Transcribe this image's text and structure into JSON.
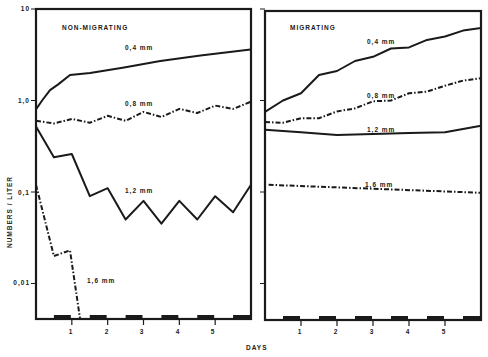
{
  "chart_data": [
    {
      "type": "line",
      "title": "NON-MIGRATING",
      "xlabel": "DAYS",
      "ylabel": "NUMBERS / LITER",
      "yscale": "log",
      "ylim": [
        0.004,
        10
      ],
      "xlim": [
        0,
        6
      ],
      "xticks": [
        1,
        2,
        3,
        4,
        5
      ],
      "yticks": [
        10,
        1.0,
        0.1,
        0.01
      ],
      "ytick_labels": [
        "10",
        "1,0",
        "0,1",
        "0,01"
      ],
      "grid": false,
      "night_bars": [
        [
          0.5,
          1.0
        ],
        [
          1.5,
          2.0
        ],
        [
          2.5,
          3.0
        ],
        [
          3.5,
          4.0
        ],
        [
          4.5,
          5.0
        ],
        [
          5.5,
          6.0
        ]
      ],
      "series": [
        {
          "name": "0,4 mm",
          "style": "solid",
          "x": [
            0,
            0.17,
            0.39,
            0.62,
            0.95,
            1.51,
            2.46,
            3.47,
            4.59,
            5.99
          ],
          "values": [
            0.8,
            1.0,
            1.3,
            1.5,
            1.9,
            2.0,
            2.3,
            2.7,
            3.1,
            3.6
          ]
        },
        {
          "name": "0,8 mm",
          "style": "dashdot",
          "x": [
            0,
            0.5,
            1.0,
            1.5,
            2.0,
            2.5,
            3.0,
            3.5,
            4.0,
            4.5,
            5.0,
            5.5,
            6.0
          ],
          "values": [
            0.6,
            0.56,
            0.63,
            0.57,
            0.68,
            0.6,
            0.75,
            0.66,
            0.81,
            0.73,
            0.88,
            0.81,
            0.97
          ]
        },
        {
          "name": "1,2 mm",
          "style": "solid",
          "x": [
            0,
            0.5,
            1.0,
            1.5,
            2.0,
            2.5,
            3.0,
            3.5,
            4.0,
            4.5,
            5.0,
            5.5,
            6.0
          ],
          "values": [
            0.52,
            0.24,
            0.26,
            0.09,
            0.11,
            0.05,
            0.08,
            0.045,
            0.08,
            0.05,
            0.09,
            0.06,
            0.12
          ]
        },
        {
          "name": "1,6 mm",
          "style": "dashdot",
          "x": [
            0,
            0.5,
            0.95,
            1.23
          ],
          "values": [
            0.12,
            0.02,
            0.023,
            0.004
          ]
        }
      ],
      "annotations": [
        "NON-MIGRATING",
        "0,4 mm",
        "0,8 mm",
        "1,2 mm",
        "1,6 mm"
      ]
    },
    {
      "type": "line",
      "title": "MIGRATING",
      "xlabel": "DAYS",
      "ylabel": "NUMBERS / LITER",
      "yscale": "log",
      "ylim": [
        0.004,
        10
      ],
      "xlim": [
        0,
        6
      ],
      "xticks": [
        1,
        2,
        3,
        4,
        5
      ],
      "yticks": [
        10,
        1.0,
        0.1,
        0.01
      ],
      "grid": false,
      "night_bars": [
        [
          0.5,
          1.0
        ],
        [
          1.5,
          2.0
        ],
        [
          2.5,
          3.0
        ],
        [
          3.5,
          4.0
        ],
        [
          4.5,
          5.0
        ],
        [
          5.5,
          6.0
        ]
      ],
      "series": [
        {
          "name": "0,4 mm",
          "style": "solid",
          "x": [
            0,
            0.5,
            1.0,
            1.5,
            2.0,
            2.5,
            3.0,
            3.5,
            4.0,
            4.5,
            5.0,
            5.5,
            6.0
          ],
          "values": [
            0.75,
            1.0,
            1.2,
            1.9,
            2.1,
            2.7,
            3.0,
            3.7,
            3.8,
            4.6,
            5.0,
            5.8,
            6.2
          ]
        },
        {
          "name": "0,8 mm",
          "style": "dashdot",
          "x": [
            0,
            0.5,
            1.0,
            1.5,
            2.0,
            2.5,
            3.0,
            3.5,
            4.0,
            4.5,
            5.0,
            5.5,
            6.0
          ],
          "values": [
            0.58,
            0.57,
            0.64,
            0.64,
            0.76,
            0.82,
            0.98,
            1.0,
            1.2,
            1.25,
            1.45,
            1.65,
            1.75
          ]
        },
        {
          "name": "1,2 mm",
          "style": "solid",
          "x": [
            0,
            1.0,
            2.0,
            3.0,
            4.0,
            5.0,
            6.0
          ],
          "values": [
            0.48,
            0.45,
            0.42,
            0.43,
            0.44,
            0.45,
            0.53
          ]
        },
        {
          "name": "1,6 mm",
          "style": "dashdot",
          "x": [
            0.1,
            6.0
          ],
          "values": [
            0.12,
            0.098
          ]
        }
      ],
      "annotations": [
        "MIGRATING",
        "0,4 mm",
        "0,8 mm",
        "1,2 mm",
        "1,6 mm"
      ]
    }
  ],
  "labels": {
    "panel_left_title": "NON-MIGRATING",
    "panel_right_title": "MIGRATING",
    "ylabel": "NUMBERS / LITER",
    "xlabel": "DAYS",
    "yticks": [
      "10",
      "1,0",
      "0,1",
      "0,01"
    ],
    "xticks": [
      "1",
      "2",
      "3",
      "4",
      "5"
    ],
    "left_series_labels": [
      "0,4 mm",
      "0,8 mm",
      "1,2 mm",
      "1,6 mm"
    ],
    "right_series_labels": [
      "0,4 mm",
      "0,8 mm",
      "1,2 mm",
      "1,6 mm"
    ]
  },
  "colors": {
    "ink": "#1a1a1a",
    "background": "#ffffff"
  }
}
